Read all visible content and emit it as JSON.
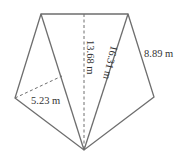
{
  "diagram": {
    "type": "pentagon-area-decomposition",
    "colors": {
      "stroke": "#6e6e6e",
      "text": "#333333",
      "background": "#ffffff"
    },
    "vertices": {
      "top_left": [
        41,
        14
      ],
      "top_right": [
        128,
        14
      ],
      "right": [
        154,
        97
      ],
      "bottom": [
        84,
        150
      ],
      "left": [
        15,
        98
      ]
    },
    "labels": {
      "height": "13.68 m",
      "diagonal": "16.31 m",
      "right_side": "8.89 m",
      "left_height": "5.23 m"
    }
  }
}
